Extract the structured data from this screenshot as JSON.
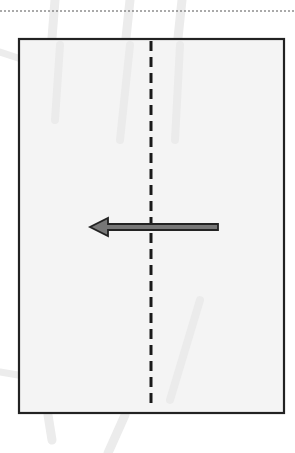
{
  "diagram": {
    "type": "fold-instruction",
    "colors": {
      "background": "#ffffff",
      "paper_fill": "#f4f4f4",
      "paper_border": "#222222",
      "fold_line": "#1a1a1a",
      "arrow_fill": "#777777",
      "arrow_stroke": "#222222",
      "top_dotted_line": "#555555",
      "bleed_through": "#e6e6e6"
    },
    "elements": {
      "top_rule": "dotted horizontal line",
      "paper": "rectangle sheet",
      "fold_line": "vertical dashed valley fold line",
      "arrow": "fold direction arrow pointing left"
    }
  }
}
